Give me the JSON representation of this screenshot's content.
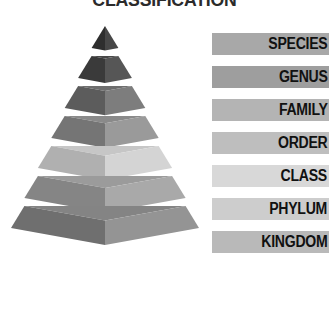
{
  "title": "CLASSIFICATION",
  "background": "#ffffff",
  "pyramid": {
    "name": "taxonomic-rank-pyramid",
    "tiers": [
      {
        "rank": "SPECIES",
        "level": 1,
        "fill": "#3a3a3a",
        "left_face": "#2e2e2e",
        "right_face": "#474747"
      },
      {
        "rank": "GENUS",
        "level": 2,
        "fill": "#484848",
        "left_face": "#3a3a3a",
        "right_face": "#565656"
      },
      {
        "rank": "FAMILY",
        "level": 3,
        "fill": "#6e6e6e",
        "left_face": "#5c5c5c",
        "right_face": "#7d7d7d"
      },
      {
        "rank": "ORDER",
        "level": 4,
        "fill": "#8a8a8a",
        "left_face": "#757575",
        "right_face": "#9a9a9a"
      },
      {
        "rank": "CLASS",
        "level": 5,
        "fill": "#c6c6c6",
        "left_face": "#b0b0b0",
        "right_face": "#d4d4d4"
      },
      {
        "rank": "PHYLUM",
        "level": 6,
        "fill": "#9b9b9b",
        "left_face": "#858585",
        "right_face": "#a9a9a9"
      },
      {
        "rank": "KINGDOM",
        "level": 7,
        "fill": "#848484",
        "left_face": "#6f6f6f",
        "right_face": "#949494"
      }
    ]
  },
  "legend": {
    "items": [
      {
        "label": "SPECIES",
        "swatch": "#a8a8a8"
      },
      {
        "label": "GENUS",
        "swatch": "#9e9e9e"
      },
      {
        "label": "FAMILY",
        "swatch": "#b4b4b4"
      },
      {
        "label": "ORDER",
        "swatch": "#bebebe"
      },
      {
        "label": "CLASS",
        "swatch": "#d8d8d8"
      },
      {
        "label": "PHYLUM",
        "swatch": "#cdcdcd"
      },
      {
        "label": "KINGDOM",
        "swatch": "#b9b9b9"
      }
    ]
  }
}
